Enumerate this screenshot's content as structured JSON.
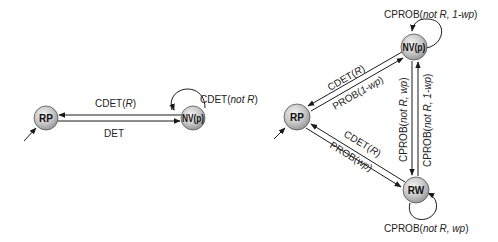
{
  "diagram_left": {
    "nodes": [
      {
        "id": "RP",
        "label": "RP"
      },
      {
        "id": "NVp",
        "label": "NV(p)"
      }
    ],
    "edges": [
      {
        "from": "NVp",
        "to": "RP",
        "label_main": "CDET(",
        "label_italic": "R",
        "label_end": ")"
      },
      {
        "from": "RP",
        "to": "NVp",
        "label_main": "DET"
      },
      {
        "from": "NVp",
        "to": "NVp",
        "label_main": "CDET(",
        "label_italic": "not R",
        "label_end": ")"
      }
    ]
  },
  "diagram_right": {
    "nodes": [
      {
        "id": "RP",
        "label": "RP"
      },
      {
        "id": "NVp",
        "label": "NV(p)"
      },
      {
        "id": "RW",
        "label": "RW"
      }
    ],
    "edges": [
      {
        "from": "NVp",
        "to": "NVp",
        "label_main": "CPROB(",
        "label_italic": "not R, 1-wp",
        "label_end": ")"
      },
      {
        "from": "NVp",
        "to": "RP",
        "label_main": "CDET(",
        "label_italic": "R",
        "label_end": ")"
      },
      {
        "from": "RP",
        "to": "NVp",
        "label_main": "PROB(",
        "label_italic": "1-wp",
        "label_end": ")"
      },
      {
        "from": "NVp",
        "to": "RW",
        "label_main": "CPROB(",
        "label_italic": "not R, wp",
        "label_end": ")"
      },
      {
        "from": "RW",
        "to": "NVp",
        "label_main": "CPROB(",
        "label_italic": "not R, 1-wp",
        "label_end": ")"
      },
      {
        "from": "RW",
        "to": "RP",
        "label_main": "CDET(",
        "label_italic": "R",
        "label_end": ")"
      },
      {
        "from": "RP",
        "to": "RW",
        "label_main": "PROB(",
        "label_italic": "wp",
        "label_end": ")"
      },
      {
        "from": "RW",
        "to": "RW",
        "label_main": "CPROB(",
        "label_italic": "not R, wp",
        "label_end": ")"
      }
    ]
  }
}
